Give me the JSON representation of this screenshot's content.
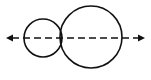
{
  "figure": {
    "type": "geometric-line-diagram",
    "width": 151,
    "height": 80,
    "background_color": "#ffffff",
    "stroke_color": "#111111",
    "stroke_width": 1.6
  },
  "axis": {
    "name": "horizontal-axis-line",
    "style": "dashed",
    "dash_length": 7,
    "dash_gap": 4,
    "y": 38,
    "x_start": 6,
    "x_end": 145,
    "left_arrowhead": true,
    "right_arrowhead": true,
    "arrowhead_length": 7,
    "arrowhead_half_width": 3.6
  },
  "shapes": [
    {
      "name": "small-circle",
      "type": "circle",
      "cx": 43,
      "cy": 38,
      "r": 19,
      "fill": "none",
      "stroke": "#111111"
    },
    {
      "name": "large-circle",
      "type": "circle",
      "cx": 91,
      "cy": 37,
      "r": 31,
      "fill": "none",
      "stroke": "#111111"
    }
  ],
  "labels": {
    "none_visible": ""
  }
}
